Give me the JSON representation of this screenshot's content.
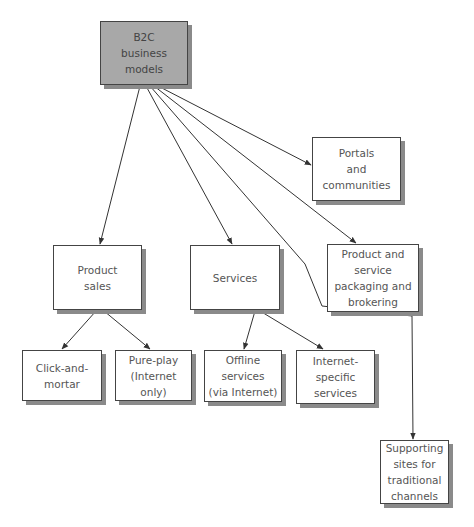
{
  "diagram": {
    "type": "tree",
    "colors": {
      "root_fill": "#a8a8a8",
      "node_fill": "#ffffff",
      "border": "#444444",
      "shadow": "#8a8a8a",
      "edge": "#333333"
    },
    "nodes": [
      {
        "id": "b2c",
        "label": "B2C\nbusiness\nmodels",
        "x": 100,
        "y": 21,
        "w": 88,
        "h": 64,
        "root": true
      },
      {
        "id": "portals",
        "label": "Portals\nand\ncommunities",
        "x": 312,
        "y": 137,
        "w": 89,
        "h": 64
      },
      {
        "id": "packaging",
        "label": "Product and\nservice\npackaging and\nbrokering",
        "x": 327,
        "y": 244,
        "w": 92,
        "h": 68
      },
      {
        "id": "product_sales",
        "label": "Product\nsales",
        "x": 53,
        "y": 245,
        "w": 89,
        "h": 65
      },
      {
        "id": "services",
        "label": "Services",
        "x": 190,
        "y": 245,
        "w": 90,
        "h": 65
      },
      {
        "id": "click_mortar",
        "label": "Click-and-\nmortar",
        "x": 22,
        "y": 350,
        "w": 80,
        "h": 51
      },
      {
        "id": "pure_play",
        "label": "Pure-play\n(Internet only)",
        "x": 115,
        "y": 350,
        "w": 77,
        "h": 51
      },
      {
        "id": "offline",
        "label": "Offline\nservices\n(via Internet)",
        "x": 204,
        "y": 350,
        "w": 78,
        "h": 52
      },
      {
        "id": "internet_specific",
        "label": "Internet-\nspecific\nservices",
        "x": 296,
        "y": 350,
        "w": 79,
        "h": 54
      },
      {
        "id": "supporting",
        "label": "Supporting\nsites for\ntraditional\nchannels",
        "x": 380,
        "y": 440,
        "w": 69,
        "h": 64
      }
    ],
    "edges": [
      {
        "from": "b2c",
        "to": "product_sales",
        "points": [
          [
            140,
            86
          ],
          [
            100,
            244
          ]
        ]
      },
      {
        "from": "b2c",
        "to": "services",
        "points": [
          [
            146,
            86
          ],
          [
            232,
            244
          ]
        ]
      },
      {
        "from": "b2c",
        "to": "supporting",
        "points": [
          [
            150,
            86
          ],
          [
            305,
            264
          ],
          [
            322,
            306
          ],
          [
            412,
            316
          ],
          [
            413,
            439
          ]
        ]
      },
      {
        "from": "b2c",
        "to": "packaging",
        "points": [
          [
            154,
            86
          ],
          [
            356,
            243
          ]
        ]
      },
      {
        "from": "b2c",
        "to": "portals",
        "points": [
          [
            158,
            86
          ],
          [
            311,
            165
          ]
        ]
      },
      {
        "from": "product_sales",
        "to": "click_mortar",
        "points": [
          [
            96,
            311
          ],
          [
            62,
            349
          ]
        ]
      },
      {
        "from": "product_sales",
        "to": "pure_play",
        "points": [
          [
            104,
            311
          ],
          [
            150,
            349
          ]
        ]
      },
      {
        "from": "services",
        "to": "offline",
        "points": [
          [
            255,
            311
          ],
          [
            244,
            349
          ]
        ]
      },
      {
        "from": "services",
        "to": "internet_specific",
        "points": [
          [
            260,
            311
          ],
          [
            323,
            349
          ]
        ]
      }
    ]
  }
}
